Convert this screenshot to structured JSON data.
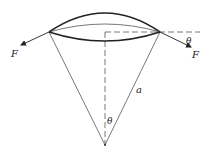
{
  "diagram": {
    "labels": {
      "force_left": "F",
      "force_right": "F",
      "angle_rim": "θ",
      "radius": "a",
      "angle_apex": "θ"
    },
    "colors": {
      "stroke": "#222222",
      "thin_stroke": "#555555",
      "background": "#ffffff"
    }
  }
}
